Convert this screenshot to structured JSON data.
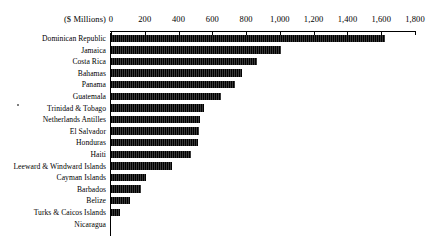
{
  "chart_data": {
    "type": "bar",
    "orientation": "horizontal",
    "title": "",
    "subtitle": "",
    "xlabel": "($ Millions)",
    "ylabel": "",
    "unit_label": "($ Millions)",
    "xlim": [
      0,
      1800
    ],
    "xticks": [
      0,
      200,
      400,
      600,
      800,
      1000,
      1200,
      1400,
      1600,
      1800
    ],
    "xtick_labels": [
      "0",
      "200",
      "400",
      "600",
      "800",
      "1,000",
      "1,200",
      "1,400",
      "1,600",
      "1,800"
    ],
    "grid": false,
    "legend": null,
    "categories": [
      "Dominican Republic",
      "Jamaica",
      "Costa Rica",
      "Bahamas",
      "Panama",
      "Guatemala",
      "Trinidad & Tobago",
      "Netherlands Antilles",
      "El Salvador",
      "Honduras",
      "Haiti",
      "Leeward & Windward Islands",
      "Cayman Islands",
      "Barbados",
      "Belize",
      "Turks & Caicos Islands",
      "Nicaragua"
    ],
    "values": [
      1620,
      1005,
      865,
      775,
      735,
      650,
      550,
      528,
      520,
      515,
      475,
      360,
      205,
      175,
      115,
      55,
      0
    ]
  }
}
